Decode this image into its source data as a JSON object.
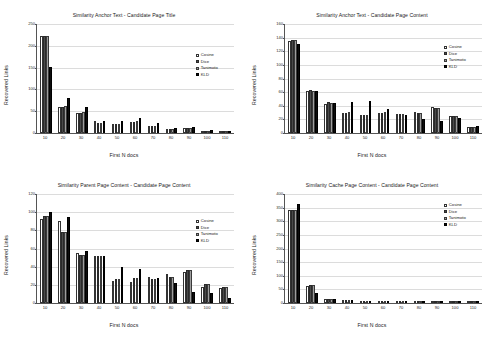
{
  "series_names": [
    "Cosine",
    "Dice",
    "Tanimoto",
    "KLD"
  ],
  "common": {
    "xlabel": "First N docs",
    "ylabel": "Recovered Links",
    "categories": [
      "10",
      "20",
      "30",
      "40",
      "50",
      "60",
      "70",
      "80",
      "90",
      "100",
      "110"
    ]
  },
  "chart_data": [
    {
      "type": "bar",
      "title": "Similarity Anchor Text - Candidate Page Title",
      "xlabel": "First N docs",
      "ylabel": "Recovered Links",
      "categories": [
        "10",
        "20",
        "30",
        "40",
        "50",
        "60",
        "70",
        "80",
        "90",
        "100",
        "110"
      ],
      "ylim": [
        0,
        250
      ],
      "yticks": [
        0,
        50,
        100,
        150,
        200,
        250
      ],
      "grid": true,
      "legend_position": "top-right",
      "series": [
        {
          "name": "Cosine",
          "values": [
            222,
            60,
            46,
            28,
            21,
            26,
            15,
            10,
            11,
            5,
            2
          ]
        },
        {
          "name": "Dice",
          "values": [
            222,
            60,
            46,
            23,
            20,
            26,
            15,
            10,
            11,
            5,
            2
          ]
        },
        {
          "name": "Tanimoto",
          "values": [
            222,
            61,
            48,
            24,
            21,
            27,
            15,
            10,
            11,
            5,
            2
          ]
        },
        {
          "name": "KLD",
          "values": [
            151,
            81,
            60,
            28,
            28,
            34,
            22,
            12,
            13,
            7,
            3
          ]
        }
      ]
    },
    {
      "type": "bar",
      "title": "Similarity Anchor Text - Candidate Page Content",
      "xlabel": "First N docs",
      "ylabel": "Recovered Links",
      "categories": [
        "10",
        "20",
        "30",
        "40",
        "50",
        "60",
        "70",
        "80",
        "90",
        "100",
        "110"
      ],
      "ylim": [
        0,
        160
      ],
      "yticks": [
        0,
        20,
        40,
        60,
        80,
        100,
        120,
        140,
        160
      ],
      "grid": true,
      "legend_position": "top-right",
      "series": [
        {
          "name": "Cosine",
          "values": [
            135,
            62,
            42,
            30,
            26,
            30,
            28,
            31,
            38,
            25,
            9
          ]
        },
        {
          "name": "Dice",
          "values": [
            136,
            63,
            45,
            30,
            26,
            30,
            28,
            29,
            37,
            25,
            9
          ]
        },
        {
          "name": "Tanimoto",
          "values": [
            136,
            62,
            44,
            31,
            26,
            31,
            28,
            29,
            36,
            25,
            9
          ]
        },
        {
          "name": "KLD",
          "values": [
            131,
            61,
            44,
            45,
            47,
            35,
            26,
            20,
            17,
            22,
            10
          ]
        }
      ]
    },
    {
      "type": "bar",
      "title": "Similarity Parent Page Content - Candidate Page Content",
      "xlabel": "First N docs",
      "ylabel": "Recovered Links",
      "categories": [
        "10",
        "20",
        "30",
        "40",
        "50",
        "60",
        "70",
        "80",
        "90",
        "100",
        "110"
      ],
      "ylim": [
        0,
        120
      ],
      "yticks": [
        0,
        20,
        40,
        60,
        80,
        100,
        120
      ],
      "grid": true,
      "legend_position": "top-right",
      "series": [
        {
          "name": "Cosine",
          "values": [
            92,
            90,
            55,
            52,
            24,
            23,
            29,
            32,
            34,
            18,
            17
          ]
        },
        {
          "name": "Dice",
          "values": [
            96,
            78,
            53,
            52,
            26,
            27,
            26,
            29,
            36,
            21,
            18
          ]
        },
        {
          "name": "Tanimoto",
          "values": [
            96,
            78,
            53,
            52,
            26,
            27,
            26,
            29,
            36,
            21,
            18
          ]
        },
        {
          "name": "KLD",
          "values": [
            100,
            95,
            57,
            52,
            40,
            37,
            28,
            22,
            12,
            11,
            5
          ]
        }
      ]
    },
    {
      "type": "bar",
      "title": "Similarity Cache Page Content - Candidate Page Content",
      "xlabel": "First N docs",
      "ylabel": "Recovered Links",
      "categories": [
        "10",
        "20",
        "30",
        "40",
        "50",
        "60",
        "70",
        "80",
        "90",
        "100",
        "110"
      ],
      "ylim": [
        0,
        400
      ],
      "yticks": [
        0,
        50,
        100,
        150,
        200,
        250,
        300,
        350,
        400
      ],
      "grid": true,
      "legend_position": "top-right",
      "series": [
        {
          "name": "Cosine",
          "values": [
            340,
            64,
            14,
            12,
            4,
            3,
            2,
            5,
            7,
            3,
            2
          ]
        },
        {
          "name": "Dice",
          "values": [
            340,
            65,
            14,
            12,
            4,
            3,
            2,
            5,
            7,
            3,
            2
          ]
        },
        {
          "name": "Tanimoto",
          "values": [
            341,
            65,
            14,
            12,
            4,
            3,
            2,
            5,
            7,
            3,
            2
          ]
        },
        {
          "name": "KLD",
          "values": [
            364,
            35,
            13,
            12,
            4,
            3,
            2,
            5,
            6,
            3,
            2
          ]
        }
      ]
    }
  ],
  "legend_boxes": [
    {
      "top": 52,
      "left": 196
    },
    {
      "top": 44,
      "left": 444
    },
    {
      "top": 218,
      "left": 196
    },
    {
      "top": 202,
      "left": 444
    }
  ]
}
